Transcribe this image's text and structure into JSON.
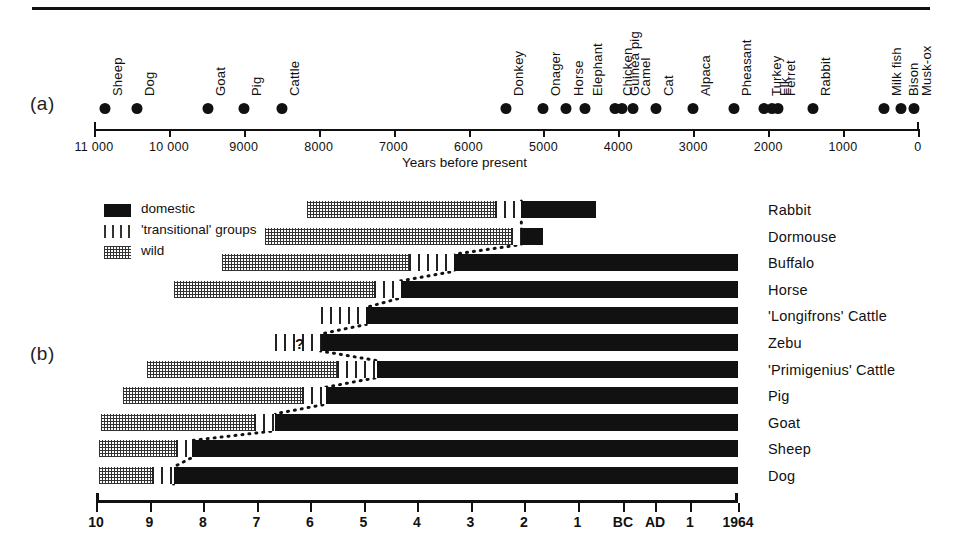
{
  "figure": {
    "panel_a_label": "(a)",
    "panel_b_label": "(b)"
  },
  "panel_a": {
    "axis_title": "Years before present",
    "axis_ticks": [
      {
        "label": "11 000",
        "value": 11000
      },
      {
        "label": "10 000",
        "value": 10000
      },
      {
        "label": "9000",
        "value": 9000
      },
      {
        "label": "8000",
        "value": 8000
      },
      {
        "label": "7000",
        "value": 7000
      },
      {
        "label": "6000",
        "value": 6000
      },
      {
        "label": "5000",
        "value": 5000
      },
      {
        "label": "4000",
        "value": 4000
      },
      {
        "label": "3000",
        "value": 3000
      },
      {
        "label": "2000",
        "value": 2000
      },
      {
        "label": "1000",
        "value": 1000
      },
      {
        "label": "0",
        "value": 0
      }
    ],
    "species": [
      {
        "name": "Sheep",
        "years_bp": 10850
      },
      {
        "name": "Dog",
        "years_bp": 10420
      },
      {
        "name": "Goat",
        "years_bp": 9480
      },
      {
        "name": "Pig",
        "years_bp": 9000
      },
      {
        "name": "Cattle",
        "years_bp": 8490
      },
      {
        "name": "Donkey",
        "years_bp": 5500
      },
      {
        "name": "Onager",
        "years_bp": 5000
      },
      {
        "name": "Horse",
        "years_bp": 4700
      },
      {
        "name": "Elephant",
        "years_bp": 4450
      },
      {
        "name": "Chicken",
        "years_bp": 4050
      },
      {
        "name": "Guinea pig",
        "years_bp": 3950
      },
      {
        "name": "Camel",
        "years_bp": 3800
      },
      {
        "name": "Cat",
        "years_bp": 3500
      },
      {
        "name": "Alpaca",
        "years_bp": 3000
      },
      {
        "name": "Pheasant",
        "years_bp": 2450
      },
      {
        "name": "Turkey",
        "years_bp": 2050
      },
      {
        "name": "Elk",
        "years_bp": 1950
      },
      {
        "name": "Ferret",
        "years_bp": 1870
      },
      {
        "name": "Rabbit",
        "years_bp": 1400
      },
      {
        "name": "Milk fish",
        "years_bp": 450
      },
      {
        "name": "Bison",
        "years_bp": 230
      },
      {
        "name": "Musk-ox",
        "years_bp": 60
      }
    ]
  },
  "panel_b": {
    "legend": [
      {
        "key": "dom",
        "label": "domestic"
      },
      {
        "key": "trans",
        "label": "'transitional' groups"
      },
      {
        "key": "wild",
        "label": "wild"
      }
    ],
    "axis_ticks": [
      {
        "label": "10",
        "pos": 0.0
      },
      {
        "label": "9",
        "pos": 1.0
      },
      {
        "label": "8",
        "pos": 2.0
      },
      {
        "label": "7",
        "pos": 3.0
      },
      {
        "label": "6",
        "pos": 4.0
      },
      {
        "label": "5",
        "pos": 5.0
      },
      {
        "label": "4",
        "pos": 6.0
      },
      {
        "label": "3",
        "pos": 7.0
      },
      {
        "label": "2",
        "pos": 8.0
      },
      {
        "label": "1",
        "pos": 9.0
      },
      {
        "label": "BC",
        "pos": 9.85
      },
      {
        "label": "AD",
        "pos": 10.45
      },
      {
        "label": "1",
        "pos": 11.1
      },
      {
        "label": "1964",
        "pos": 12.0
      }
    ],
    "axis_note": "Thousands of years BC, then BC/AD, ending 1964",
    "annotations": [
      {
        "text": "?",
        "row": "Zebu",
        "kind": "question-mark"
      },
      {
        "text": "?",
        "row": "Zebu",
        "kind": "question-mark-inverted"
      }
    ],
    "rows": [
      {
        "species": "Rabbit",
        "wild_start": 3.95,
        "wild_end": 7.45,
        "trans_end": 7.95,
        "dom_end": 9.35
      },
      {
        "species": "Dormouse",
        "wild_start": 3.15,
        "wild_end": 7.75,
        "trans_end": 7.95,
        "dom_end": 8.35
      },
      {
        "species": "Buffalo",
        "wild_start": 2.35,
        "wild_end": 5.85,
        "trans_end": 6.7,
        "dom_end": 12.0
      },
      {
        "species": "Horse",
        "wild_start": 1.45,
        "wild_end": 5.2,
        "trans_end": 5.7,
        "dom_end": 12.0
      },
      {
        "species": "'Longifrons' Cattle",
        "wild_start": null,
        "wild_end": null,
        "trans_end": 5.05,
        "dom_end": 12.0
      },
      {
        "species": "Zebu",
        "wild_start": null,
        "wild_end": null,
        "trans_end": 4.2,
        "dom_end": 12.0
      },
      {
        "species": "'Primigenius' Cattle",
        "wild_start": 0.95,
        "wild_end": 4.5,
        "trans_end": 5.25,
        "dom_end": 12.0
      },
      {
        "species": "Pig",
        "wild_start": 0.5,
        "wild_end": 3.85,
        "trans_end": 4.3,
        "dom_end": 12.0
      },
      {
        "species": "Goat",
        "wild_start": 0.1,
        "wild_end": 2.95,
        "trans_end": 3.35,
        "dom_end": 12.0
      },
      {
        "species": "Sheep",
        "wild_start": 0.05,
        "wild_end": 1.5,
        "trans_end": 1.8,
        "dom_end": 12.0
      },
      {
        "species": "Dog",
        "wild_start": 0.05,
        "wild_end": 1.05,
        "trans_end": 1.45,
        "dom_end": 12.0
      }
    ]
  },
  "colors": {
    "ink": "#111111",
    "paper": "#ffffff"
  }
}
